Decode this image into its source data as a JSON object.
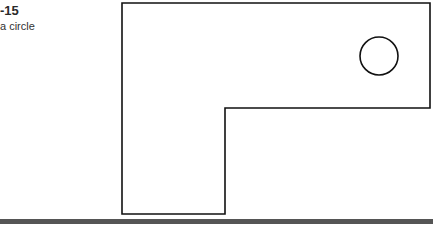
{
  "caption": {
    "figure_number": "-15",
    "description": "a circle"
  },
  "drawing": {
    "shape": "L-shaped plate with circular hole",
    "stroke_color": "#111111",
    "outline_points": [
      [
        122,
        3
      ],
      [
        430,
        3
      ],
      [
        430,
        108
      ],
      [
        225,
        108
      ],
      [
        225,
        214
      ],
      [
        122,
        214
      ]
    ],
    "circle": {
      "cx": 379,
      "cy": 56,
      "r": 19
    }
  },
  "rule_color": "#555555"
}
